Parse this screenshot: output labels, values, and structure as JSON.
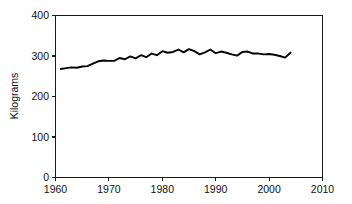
{
  "chart_data": {
    "type": "line",
    "title": "",
    "subtitle": "",
    "xlabel": "",
    "ylabel": "Kilograms",
    "xlim": [
      1960,
      2010
    ],
    "ylim": [
      0,
      400
    ],
    "xticks": [
      1960,
      1970,
      1980,
      1990,
      2000,
      2010
    ],
    "yticks": [
      0,
      100,
      200,
      300,
      400
    ],
    "xtick_labels": [
      "1960",
      "1970",
      "1980",
      "1990",
      "2000",
      "2010"
    ],
    "ytick_labels": [
      "0",
      "100",
      "200",
      "300",
      "400"
    ],
    "grid": false,
    "legend": null,
    "legend_position": "none",
    "series": [
      {
        "name": "Kilograms",
        "color": "#000000",
        "x": [
          1961,
          1962,
          1963,
          1964,
          1965,
          1966,
          1967,
          1968,
          1969,
          1970,
          1971,
          1972,
          1973,
          1974,
          1975,
          1976,
          1977,
          1978,
          1979,
          1980,
          1981,
          1982,
          1983,
          1984,
          1985,
          1986,
          1987,
          1988,
          1989,
          1990,
          1991,
          1992,
          1993,
          1994,
          1995,
          1996,
          1997,
          1998,
          1999,
          2000,
          2001,
          2002,
          2003,
          2004
        ],
        "values": [
          268,
          270,
          272,
          271,
          274,
          275,
          281,
          287,
          289,
          288,
          288,
          295,
          292,
          299,
          294,
          302,
          297,
          306,
          302,
          312,
          308,
          310,
          316,
          309,
          317,
          312,
          304,
          309,
          316,
          307,
          311,
          308,
          304,
          301,
          310,
          311,
          306,
          306,
          304,
          305,
          303,
          300,
          296,
          308
        ]
      }
    ]
  },
  "axes": {
    "ylabel": "Kilograms"
  }
}
